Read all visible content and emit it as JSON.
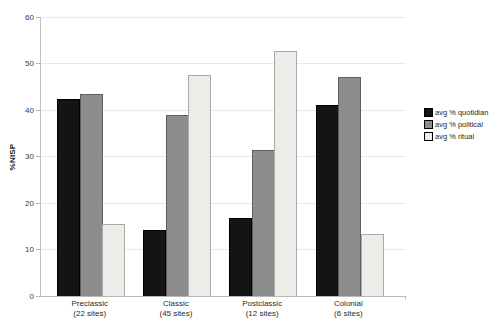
{
  "chart_data": {
    "type": "bar",
    "title": "",
    "xlabel": "",
    "ylabel": "%NISP",
    "ylim": [
      0,
      60
    ],
    "yticks": [
      0,
      10,
      20,
      30,
      40,
      50,
      60
    ],
    "grid": true,
    "legend_position": "right",
    "categories": [
      {
        "name": "Preclassic",
        "sub": "(22 sites)"
      },
      {
        "name": "Classic",
        "sub": "(45 sites)"
      },
      {
        "name": "Postclassic",
        "sub": "(12 sites)"
      },
      {
        "name": "Colonial",
        "sub": "(6 sites)"
      }
    ],
    "series": [
      {
        "name": "avg % quotidian",
        "color": "#141414",
        "border": "#000000",
        "values": [
          42.3,
          14.3,
          16.8,
          41.0
        ]
      },
      {
        "name": "avg % political",
        "color": "#8d8d8d",
        "border": "#5f5f5f",
        "values": [
          43.4,
          39.0,
          31.5,
          47.0
        ]
      },
      {
        "name": "avg % ritual",
        "color": "#ecece8",
        "border": "#a8a8a8",
        "values": [
          15.4,
          47.6,
          52.7,
          13.3
        ]
      }
    ]
  },
  "colors": {
    "background": "#ffffff",
    "gridline": "#e9e9e9",
    "axis": "#b8b8b8"
  }
}
